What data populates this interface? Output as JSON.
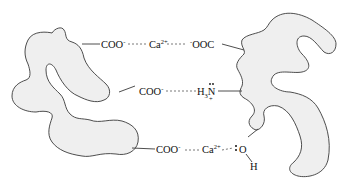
{
  "diagram": {
    "title": "",
    "colors": {
      "protein_fill": "#efefef",
      "outline": "#3a3a3a",
      "text": "#111111"
    },
    "left_protein": {
      "name": "protein-left",
      "shape": "irregular-blob"
    },
    "right_protein": {
      "name": "protein-right",
      "shape": "irregular-blob"
    },
    "interactions": [
      {
        "type": "calcium-bridge",
        "left_group": {
          "base": "COO",
          "charge": "-"
        },
        "bridge": {
          "base": "Ca",
          "charge": "2+"
        },
        "right_group": {
          "charge": "-",
          "base": "OOC"
        }
      },
      {
        "type": "salt-bridge",
        "left_group": {
          "base": "COO",
          "charge": "-"
        },
        "right_group": {
          "h": "H",
          "h_sub": "3",
          "n": "N",
          "n_charge": "+"
        }
      },
      {
        "type": "calcium-hydroxyl",
        "left_group": {
          "base": "COO",
          "charge": "-"
        },
        "bridge": {
          "base": "Ca",
          "charge": "2+"
        },
        "right_group": {
          "o": "O",
          "h": "H"
        }
      }
    ]
  }
}
